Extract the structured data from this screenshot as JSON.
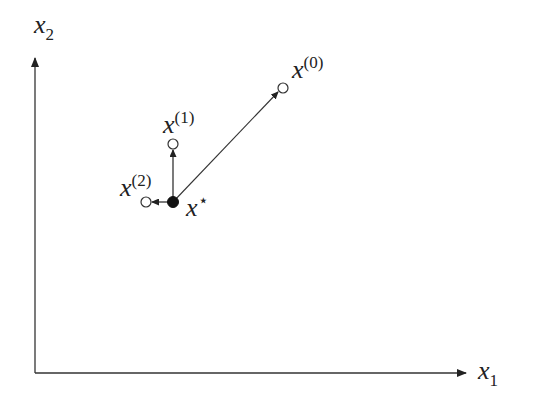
{
  "diagram": {
    "axes": {
      "x_label": {
        "base": "x",
        "sub": "1"
      },
      "y_label": {
        "base": "x",
        "sub": "2"
      }
    },
    "points": [
      {
        "id": "x0",
        "base": "x",
        "sup": "(0)",
        "filled": false
      },
      {
        "id": "x1",
        "base": "x",
        "sup": "(1)",
        "filled": false
      },
      {
        "id": "x2",
        "base": "x",
        "sup": "(2)",
        "filled": false
      },
      {
        "id": "xstar",
        "base": "x",
        "sup": "⋆",
        "filled": true
      }
    ],
    "arrows": [
      {
        "from": "xstar",
        "to": "x0"
      },
      {
        "from": "xstar",
        "to": "x1"
      },
      {
        "from": "xstar",
        "to": "x2"
      }
    ],
    "colors": {
      "line": "#333333",
      "axis": "#333333",
      "text": "#222222"
    }
  }
}
